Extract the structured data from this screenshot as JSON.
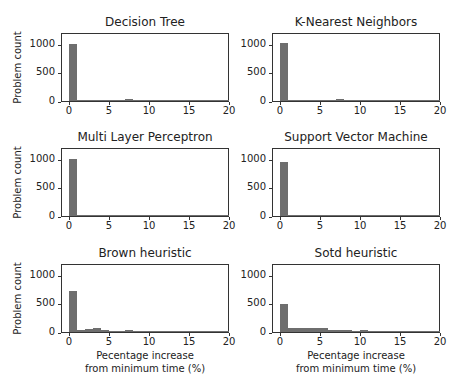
{
  "chart_data": [
    {
      "type": "bar",
      "title": "Decision Tree",
      "xlabel": "",
      "ylabel": "Problem count",
      "xlim": [
        -1,
        20
      ],
      "ylim": [
        0,
        1200
      ],
      "xticks": [
        "0",
        "5",
        "10",
        "15",
        "20"
      ],
      "yticks": [
        "0",
        "500",
        "1000"
      ],
      "bin_width": 1,
      "bins": [
        0,
        1,
        2,
        3,
        4,
        5,
        6,
        7,
        8,
        9,
        10,
        11,
        12,
        13,
        14,
        15,
        16,
        17,
        18,
        19
      ],
      "values": [
        1000,
        20,
        12,
        15,
        15,
        18,
        18,
        28,
        5,
        5,
        10,
        8,
        14,
        14,
        5,
        6,
        5,
        3,
        2,
        2
      ]
    },
    {
      "type": "bar",
      "title": "K-Nearest Neighbors",
      "xlabel": "",
      "ylabel": "",
      "xlim": [
        -1,
        20
      ],
      "ylim": [
        0,
        1200
      ],
      "xticks": [
        "0",
        "5",
        "10",
        "15",
        "20"
      ],
      "yticks": [
        "0",
        "500",
        "1000"
      ],
      "bin_width": 1,
      "bins": [
        0,
        1,
        2,
        3,
        4,
        5,
        6,
        7,
        8,
        9,
        10,
        11,
        12,
        13,
        14,
        15,
        16,
        17,
        18,
        19
      ],
      "values": [
        1010,
        20,
        15,
        15,
        18,
        18,
        20,
        30,
        6,
        5,
        10,
        8,
        16,
        16,
        5,
        6,
        5,
        3,
        2,
        2
      ]
    },
    {
      "type": "bar",
      "title": "Multi Layer Perceptron",
      "xlabel": "",
      "ylabel": "Problem count",
      "xlim": [
        -1,
        20
      ],
      "ylim": [
        0,
        1200
      ],
      "xticks": [
        "0",
        "5",
        "10",
        "15",
        "20"
      ],
      "yticks": [
        "0",
        "500",
        "1000"
      ],
      "bin_width": 1,
      "bins": [
        0,
        1,
        2,
        3,
        4,
        5,
        6,
        7,
        8,
        9,
        10,
        11,
        12,
        13,
        14,
        15,
        16,
        17,
        18,
        19
      ],
      "values": [
        990,
        25,
        20,
        18,
        14,
        14,
        16,
        25,
        6,
        5,
        10,
        8,
        14,
        14,
        5,
        6,
        5,
        3,
        2,
        2
      ]
    },
    {
      "type": "bar",
      "title": "Support Vector Machine",
      "xlabel": "",
      "ylabel": "",
      "xlim": [
        -1,
        20
      ],
      "ylim": [
        0,
        1200
      ],
      "xticks": [
        "0",
        "5",
        "10",
        "15",
        "20"
      ],
      "yticks": [
        "0",
        "500",
        "1000"
      ],
      "bin_width": 1,
      "bins": [
        0,
        1,
        2,
        3,
        4,
        5,
        6,
        7,
        8,
        9,
        10,
        11,
        12,
        13,
        14,
        15,
        16,
        17,
        18,
        19
      ],
      "values": [
        940,
        22,
        15,
        10,
        8,
        18,
        22,
        24,
        6,
        6,
        10,
        8,
        14,
        14,
        5,
        6,
        5,
        3,
        2,
        2
      ]
    },
    {
      "type": "bar",
      "title": "Brown heuristic",
      "xlabel": "Pecentage increase\nfrom minimum time (%)",
      "ylabel": "Problem count",
      "xlim": [
        -1,
        20
      ],
      "ylim": [
        0,
        1200
      ],
      "xticks": [
        "0",
        "5",
        "10",
        "15",
        "20"
      ],
      "yticks": [
        "0",
        "500",
        "1000"
      ],
      "bin_width": 1,
      "bins": [
        0,
        1,
        2,
        3,
        4,
        5,
        6,
        7,
        8,
        9,
        10,
        11,
        12,
        13,
        14,
        15,
        16,
        17,
        18,
        19
      ],
      "values": [
        710,
        40,
        55,
        65,
        35,
        20,
        15,
        35,
        12,
        8,
        10,
        10,
        25,
        15,
        8,
        20,
        10,
        8,
        10,
        5
      ]
    },
    {
      "type": "bar",
      "title": "Sotd heuristic",
      "xlabel": "Pecentage increase\nfrom minimum time (%)",
      "ylabel": "",
      "xlim": [
        -1,
        20
      ],
      "ylim": [
        0,
        1200
      ],
      "xticks": [
        "0",
        "5",
        "10",
        "15",
        "20"
      ],
      "yticks": [
        "0",
        "500",
        "1000"
      ],
      "bin_width": 1,
      "bins": [
        0,
        1,
        2,
        3,
        4,
        5,
        6,
        7,
        8,
        9,
        10,
        11,
        12,
        13,
        14,
        15,
        16,
        17,
        18,
        19
      ],
      "values": [
        480,
        75,
        75,
        65,
        70,
        70,
        35,
        40,
        40,
        25,
        30,
        20,
        20,
        15,
        12,
        10,
        8,
        12,
        5,
        5
      ]
    }
  ],
  "layout": {
    "bar_color": "#6e6e6e",
    "panels": [
      {
        "left": 61,
        "top": 33,
        "width": 168,
        "height": 69
      },
      {
        "left": 272,
        "top": 33,
        "width": 168,
        "height": 69
      },
      {
        "left": 61,
        "top": 148,
        "width": 168,
        "height": 69
      },
      {
        "left": 272,
        "top": 148,
        "width": 168,
        "height": 69
      },
      {
        "left": 61,
        "top": 264,
        "width": 168,
        "height": 69
      },
      {
        "left": 272,
        "top": 264,
        "width": 168,
        "height": 69
      }
    ]
  }
}
